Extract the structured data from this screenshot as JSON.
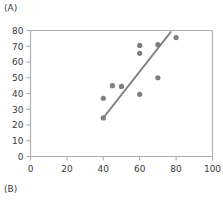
{
  "panels": {
    "a_label": "(A)",
    "b_label": "(B)"
  },
  "colors": {
    "marker": "#7f7f7f",
    "line": "#808080",
    "axis": "#b0b0b0",
    "text": "#3a3a3a",
    "background": "#ffffff"
  },
  "chart_data": {
    "type": "scatter",
    "title": "",
    "xlabel": "",
    "ylabel": "",
    "xlim": [
      0,
      100
    ],
    "ylim": [
      0,
      80
    ],
    "xticks": [
      0,
      20,
      40,
      60,
      80,
      100
    ],
    "yticks": [
      0,
      10,
      20,
      30,
      40,
      50,
      60,
      70,
      80
    ],
    "xtick_labels": [
      "0",
      "20",
      "40",
      "60",
      "80",
      "100"
    ],
    "ytick_labels": [
      "0",
      "10",
      "20",
      "30",
      "40",
      "50",
      "60",
      "70",
      "80"
    ],
    "grid": false,
    "legend": null,
    "points": [
      {
        "x": 40,
        "y": 24.5
      },
      {
        "x": 40,
        "y": 37
      },
      {
        "x": 45,
        "y": 45
      },
      {
        "x": 50,
        "y": 44.5
      },
      {
        "x": 60,
        "y": 39.5
      },
      {
        "x": 60,
        "y": 65.5
      },
      {
        "x": 60,
        "y": 70.5
      },
      {
        "x": 70,
        "y": 50
      },
      {
        "x": 70,
        "y": 71
      },
      {
        "x": 80,
        "y": 75.5
      }
    ],
    "series": [
      {
        "name": "observations",
        "type": "scatter",
        "x": [
          40,
          40,
          45,
          50,
          60,
          60,
          60,
          70,
          70,
          80
        ],
        "values": [
          24.5,
          37,
          45,
          44.5,
          39.5,
          65.5,
          70.5,
          50,
          71,
          75.5
        ]
      },
      {
        "name": "trend-line",
        "type": "line",
        "x": [
          40,
          77
        ],
        "values": [
          24.5,
          79
        ]
      }
    ],
    "trendline": {
      "x_start": 40,
      "y_start": 24.5,
      "x_end": 77,
      "y_end": 79
    }
  }
}
